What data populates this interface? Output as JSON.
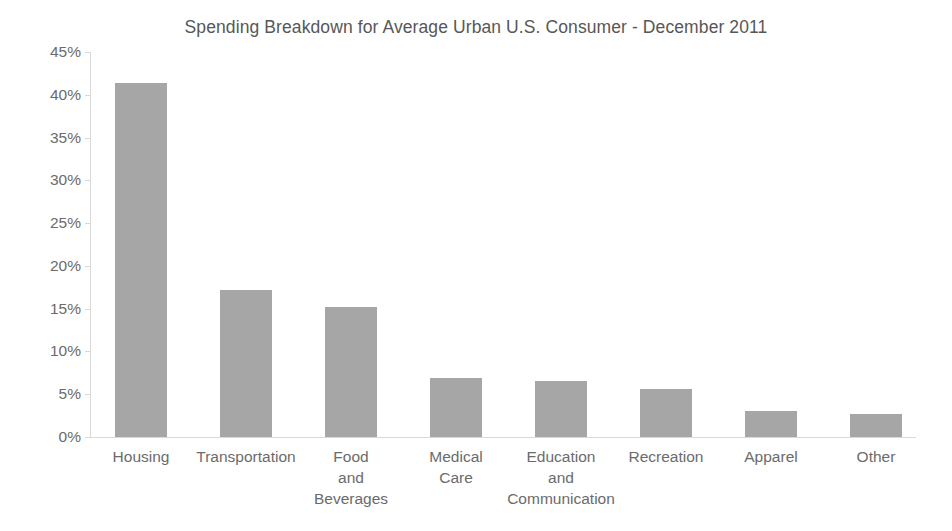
{
  "chart_data": {
    "type": "bar",
    "title": "Spending Breakdown for Average Urban U.S. Consumer - December 2011",
    "xlabel": "",
    "ylabel": "",
    "ylim": [
      0,
      45
    ],
    "ytick_labels": [
      "0%",
      "5%",
      "10%",
      "15%",
      "20%",
      "25%",
      "30%",
      "35%",
      "40%",
      "45%"
    ],
    "ytick_values": [
      0,
      5,
      10,
      15,
      20,
      25,
      30,
      35,
      40,
      45
    ],
    "grid": false,
    "legend": false,
    "bar_color": "#a6a6a6",
    "axis_color": "#d9d9d9",
    "categories": [
      "Housing",
      "Transportation",
      "Food and Beverages",
      "Medical Care",
      "Education and Communication",
      "Recreation",
      "Apparel",
      "Other"
    ],
    "category_lines": [
      [
        "Housing"
      ],
      [
        "Transportation"
      ],
      [
        "Food",
        "and",
        "Beverages"
      ],
      [
        "Medical",
        "Care"
      ],
      [
        "Education",
        "and",
        "Communication"
      ],
      [
        "Recreation"
      ],
      [
        "Apparel"
      ],
      [
        "Other"
      ]
    ],
    "values": [
      41.4,
      17.2,
      15.2,
      6.9,
      6.5,
      5.6,
      3.0,
      2.7
    ]
  }
}
